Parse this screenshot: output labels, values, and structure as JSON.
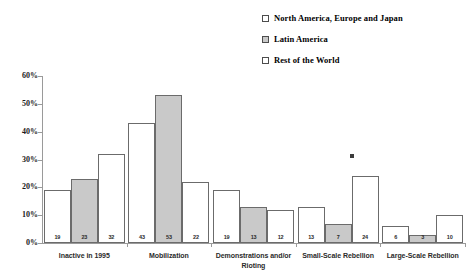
{
  "chart_data": {
    "type": "bar",
    "title": "",
    "subtitle": "",
    "xlabel": "",
    "ylabel": "",
    "ylim": [
      0,
      60
    ],
    "ytick_labels": [
      "0%",
      "10%",
      "20%",
      "30%",
      "40%",
      "50%",
      "60%"
    ],
    "ytick_values": [
      0,
      10,
      20,
      30,
      40,
      50,
      60
    ],
    "grid": false,
    "legend_position": "top-right",
    "categories": [
      "Inactive in 1995",
      "Mobilization",
      "Demonstrations and/or Rioting",
      "Small-Scale Rebellion",
      "Large-Scale Rebellion"
    ],
    "category_lines": [
      [
        "Inactive in 1995"
      ],
      [
        "Mobilization"
      ],
      [
        "Demonstrations and/or",
        "Rioting"
      ],
      [
        "Small-Scale Rebellion"
      ],
      [
        "Large-Scale Rebellion"
      ]
    ],
    "series": [
      {
        "name": "North America, Europe and Japan",
        "fill": "hollow",
        "color": "#ffffff",
        "values": [
          19,
          43,
          19,
          13,
          6
        ]
      },
      {
        "name": "Latin America",
        "fill": "filled",
        "color": "#c9c9c9",
        "values": [
          23,
          53,
          13,
          7,
          3
        ]
      },
      {
        "name": "Rest of the World",
        "fill": "hollow",
        "color": "#ffffff",
        "values": [
          32,
          22,
          12,
          24,
          10
        ]
      }
    ],
    "data_labels": [
      [
        "19",
        "23",
        "32"
      ],
      [
        "43",
        "53",
        "22"
      ],
      [
        "19",
        "13",
        "12"
      ],
      [
        "13",
        "7",
        "24"
      ],
      [
        "6",
        "3",
        "10"
      ]
    ]
  },
  "legend": {
    "items": [
      {
        "label": "North America, Europe and Japan",
        "swatch": "hollow"
      },
      {
        "label": "Latin America",
        "swatch": "filled"
      },
      {
        "label": "Rest of the World",
        "swatch": "hollow"
      }
    ]
  },
  "axis": {
    "y_labels": [
      "60%",
      "50%",
      "40%",
      "30%",
      "20%",
      "10%",
      "0%"
    ]
  }
}
